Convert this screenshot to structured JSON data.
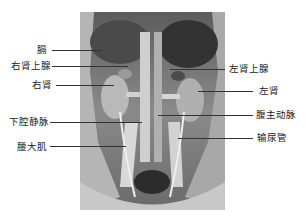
{
  "figure": {
    "type": "anatomical-photograph",
    "colors": {
      "background": "#ffffff",
      "photo_base": "#7a7a7a",
      "text": "#222222",
      "leader": "#333333"
    }
  },
  "labels": {
    "left": [
      {
        "id": "diaphragm",
        "text": "膈"
      },
      {
        "id": "right-adrenal",
        "text": "右肾上腺"
      },
      {
        "id": "right-kidney",
        "text": "右肾"
      },
      {
        "id": "ivc",
        "text": "下腔静脉"
      },
      {
        "id": "psoas-major",
        "text": "腰大肌"
      }
    ],
    "right": [
      {
        "id": "left-adrenal",
        "text": "左肾上腺"
      },
      {
        "id": "left-kidney",
        "text": "左肾"
      },
      {
        "id": "aorta",
        "text": "腹主动脉"
      },
      {
        "id": "ureter",
        "text": "输尿管"
      }
    ]
  }
}
